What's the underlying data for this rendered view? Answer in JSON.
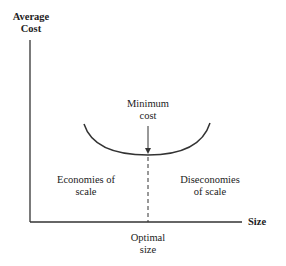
{
  "diagram": {
    "y_axis_label_line1": "Average",
    "y_axis_label_line2": "Cost",
    "x_axis_label": "Size",
    "min_label_line1": "Minimum",
    "min_label_line2": "cost",
    "left_region_line1": "Economies of",
    "left_region_line2": "scale",
    "right_region_line1": "Diseconomies",
    "right_region_line2": "of scale",
    "optimal_line1": "Optimal",
    "optimal_line2": "size"
  }
}
